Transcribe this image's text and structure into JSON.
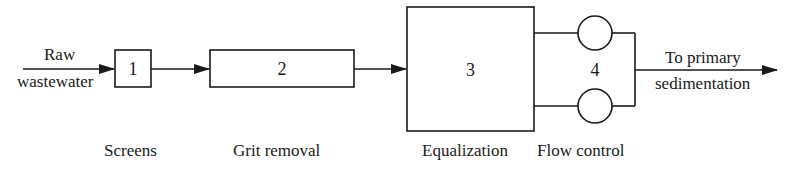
{
  "diagram": {
    "type": "process-flow",
    "input_label_line1": "Raw",
    "input_label_line2": "wastewater",
    "output_label_line1": "To primary",
    "output_label_line2": "sedimentation",
    "stages": [
      {
        "number": "1",
        "name": "Screens"
      },
      {
        "number": "2",
        "name": "Grit removal"
      },
      {
        "number": "3",
        "name": "Equalization"
      },
      {
        "number": "4",
        "name": "Flow control"
      }
    ],
    "line_color": "#1a1a1a"
  }
}
